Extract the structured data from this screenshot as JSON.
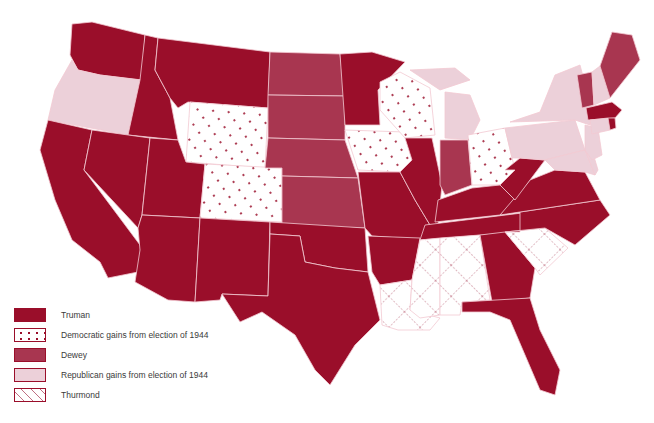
{
  "map": {
    "title": "1948 U.S. Presidential Election",
    "colors": {
      "truman": "#9a0e2a",
      "dewey": "#a83650",
      "republican_gains": "#ecd0d9",
      "democratic_gains_bg": "#ffffff",
      "thurmond_bg": "#ffffff",
      "border": "#f3c9d2"
    },
    "states": {
      "truman": [
        "WA",
        "ID",
        "MT",
        "CA",
        "NV",
        "UT",
        "AZ",
        "NM",
        "TX",
        "OK",
        "MO",
        "AR",
        "IL",
        "MN",
        "KY",
        "TN",
        "WV",
        "VA",
        "NC",
        "GA",
        "FL",
        "MA",
        "RI"
      ],
      "democratic_gains": [
        "WY",
        "CO",
        "IA",
        "WI",
        "OH"
      ],
      "dewey": [
        "ND",
        "SD",
        "NE",
        "KS",
        "IN",
        "ME",
        "VT"
      ],
      "republican_gains": [
        "OR",
        "MI",
        "NY",
        "PA",
        "NJ",
        "DE",
        "MD",
        "NH",
        "CT"
      ],
      "thurmond": [
        "LA",
        "MS",
        "AL",
        "SC"
      ]
    }
  },
  "legend": {
    "items": [
      {
        "key": "truman",
        "label": "Truman"
      },
      {
        "key": "democratic_gains",
        "label": "Democratic gains from election of 1944"
      },
      {
        "key": "dewey",
        "label": "Dewey"
      },
      {
        "key": "republican_gains",
        "label": "Republican gains from election of 1944"
      },
      {
        "key": "thurmond",
        "label": "Thurmond"
      }
    ]
  }
}
